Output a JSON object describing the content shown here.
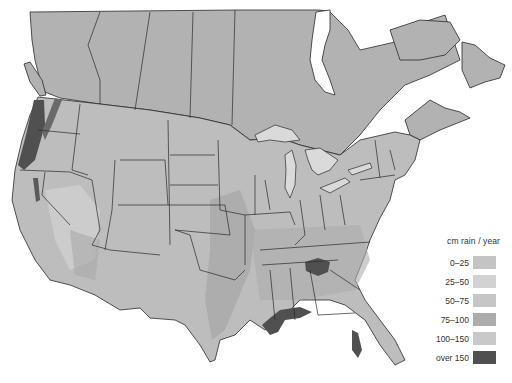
{
  "map": {
    "title": "Annual precipitation, North America",
    "background": "#ffffff",
    "land_base": "#b8b8b8",
    "canada_fill": "#b2b2b2",
    "water": "#ffffff",
    "border_color": "#2a2a2a"
  },
  "legend": {
    "title": "cm rain / year",
    "items": [
      {
        "label": "0–25",
        "color": "#c4c4c4"
      },
      {
        "label": "25–50",
        "color": "#d2d2d2"
      },
      {
        "label": "50–75",
        "color": "#c6c6c6"
      },
      {
        "label": "75–100",
        "color": "#acacac"
      },
      {
        "label": "100–150",
        "color": "#c9c9c9"
      },
      {
        "label": "over 150",
        "color": "#505050"
      }
    ]
  },
  "regions_over_150": [
    "Pacific Northwest coast (Washington/Oregon)",
    "Northern California coast / Sierra Nevada",
    "Southern Appalachians (Tennessee/North Carolina/Georgia)",
    "Gulf Coast (Louisiana/Mississippi/Alabama)",
    "South Florida"
  ]
}
